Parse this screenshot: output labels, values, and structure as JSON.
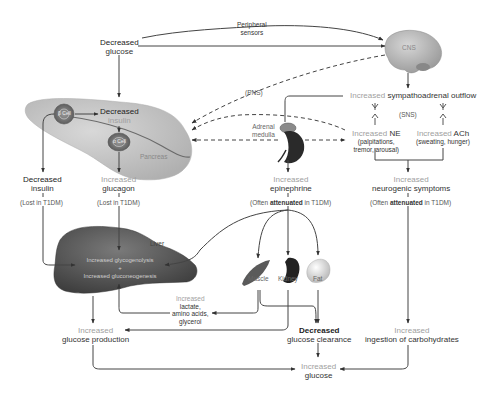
{
  "top": {
    "decreased_glucose": {
      "prefix": "Decreased",
      "main": "glucose"
    },
    "peripheral_sensors": "Peripheral\nsensors",
    "peripheral_line1": "Peripheral",
    "peripheral_line2": "sensors",
    "cns": "CNS",
    "pns": "(PNS)",
    "sns": "(SNS)"
  },
  "pancreas": {
    "label": "Pancreas",
    "beta_cell": "β Cell",
    "alpha_cell": "α Cell",
    "decreased_insulin_inner": {
      "prefix": "Decreased",
      "main": "insulin"
    }
  },
  "left_branch": {
    "decreased_insulin": {
      "prefix": "Decreased",
      "main": "insulin"
    },
    "insulin_note": "(Lost in T1DM)",
    "increased_glucagon": {
      "prefix": "Increased",
      "main": "glucagon"
    },
    "glucagon_note": "(Lost in T1DM)"
  },
  "sympathoadrenal": {
    "outflow": {
      "prefix": "Increased",
      "main": "sympathoadrenal outflow"
    },
    "adrenal_medulla": "Adrenal\nmedulla",
    "adrenal_line1": "Adrenal",
    "adrenal_line2": "medulla",
    "ne": {
      "prefix": "Increased",
      "main": "NE",
      "detail1": "(palpitations,",
      "detail2": "tremor, arousal)"
    },
    "ach": {
      "prefix": "Increased",
      "main": "ACh",
      "detail1": "(sweating, hunger)"
    },
    "epinephrine": {
      "prefix": "Increased",
      "main": "epinephrine"
    },
    "epinephrine_note": {
      "pre": "(Often ",
      "bold": "attenuated",
      "post": " in T1DM)"
    },
    "neurogenic": {
      "prefix": "Increased",
      "main": "neurogenic symptoms"
    },
    "neurogenic_note": {
      "pre": "(Often ",
      "bold": "attenuated",
      "post": " in T1DM)"
    }
  },
  "liver": {
    "label": "Liver",
    "line1": "Increased glycogenolysis",
    "plus": "+",
    "line2": "Increased gluconeogenesis"
  },
  "tissues": {
    "muscle": "Muscle",
    "kidney": "Kidney",
    "fat": "Fat",
    "substrates": {
      "prefix": "Increased",
      "line1": "lactate,",
      "line2": "amino acids,",
      "line3": "glycerol"
    }
  },
  "bottom": {
    "glucose_production": {
      "prefix": "Increased",
      "main": "glucose production"
    },
    "glucose_clearance": {
      "prefix": "Decreased",
      "main": "glucose clearance"
    },
    "carbohydrates": {
      "prefix": "Increased",
      "main": "ingestion of carbohydrates"
    },
    "glucose": {
      "prefix": "Increased",
      "main": "glucose"
    }
  },
  "colors": {
    "arrow": "#444444",
    "increased_text": "#a0a0a0",
    "pancreas_fill": "#c9c9c9",
    "liver_fill": "#5a5a5a",
    "brain_fill": "#bdbdbd"
  }
}
